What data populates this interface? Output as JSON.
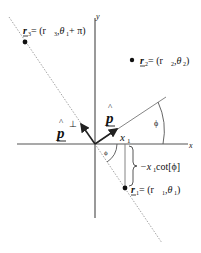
{
  "diagram": {
    "axes": {
      "x_label": "x",
      "y_label": "y"
    },
    "vectors": {
      "p_hat": {
        "label": "p",
        "hat": "^"
      },
      "p_perp": {
        "label": "p",
        "hat": "^",
        "superscript": "⊥"
      }
    },
    "labels": {
      "x1": {
        "main": "x",
        "sub": "1"
      },
      "angle_upper": "ϕ",
      "angle_lower": "ϕ",
      "offset": {
        "prefix": "−x",
        "sub": "1",
        "suffix": " cot[ϕ]"
      }
    },
    "points": [
      {
        "id": "r1",
        "name": "r",
        "sub": "1",
        "eq": " = (r",
        "sub2": "1",
        "mid": ",θ",
        "sub3": "1",
        "tail": ")"
      },
      {
        "id": "r2",
        "name": "r",
        "sub": "2",
        "eq": " = (r",
        "sub2": "2",
        "mid": ",θ",
        "sub3": "2",
        "tail": ")"
      },
      {
        "id": "r3",
        "name": "r",
        "sub": "3",
        "eq": " = (r",
        "sub2": "3",
        "mid": ",θ",
        "sub3": "1",
        "tail": " + π)"
      }
    ],
    "colors": {
      "axis": "#555555",
      "line": "#777777",
      "dotted": "#999999",
      "text": "#111111"
    }
  }
}
